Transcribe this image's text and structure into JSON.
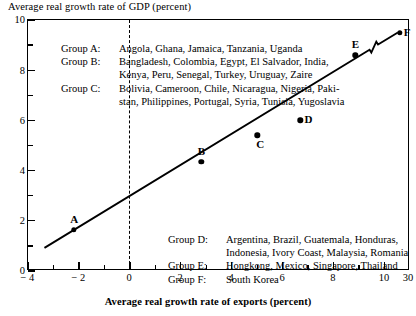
{
  "chart_data": {
    "type": "scatter",
    "title": "",
    "ylabel": "Average real growth rate of GDP (percent)",
    "xlabel": "Average real growth rate of exports (percent)",
    "xlim": [
      -4,
      11
    ],
    "ylim": [
      0,
      10
    ],
    "x_ticks": [
      {
        "value": -4,
        "label": "− 4",
        "major": true
      },
      {
        "value": -3,
        "label": "",
        "major": false
      },
      {
        "value": -2,
        "label": "− 2",
        "major": true
      },
      {
        "value": -1,
        "label": "",
        "major": false
      },
      {
        "value": 0,
        "label": "0",
        "major": true
      },
      {
        "value": 1,
        "label": "",
        "major": false
      },
      {
        "value": 2,
        "label": "2",
        "major": true
      },
      {
        "value": 3,
        "label": "",
        "major": false
      },
      {
        "value": 4,
        "label": "4",
        "major": true
      },
      {
        "value": 5,
        "label": "",
        "major": false
      },
      {
        "value": 6,
        "label": "6",
        "major": true
      },
      {
        "value": 7,
        "label": "",
        "major": false
      },
      {
        "value": 8,
        "label": "8",
        "major": true
      },
      {
        "value": 9,
        "label": "",
        "major": false
      },
      {
        "value": 10,
        "label": "10",
        "major": true
      },
      {
        "value": 11,
        "label": "30",
        "major": true
      }
    ],
    "y_ticks": [
      {
        "value": 0,
        "label": "0",
        "major": true
      },
      {
        "value": 1,
        "label": "",
        "major": false
      },
      {
        "value": 2,
        "label": "2",
        "major": true
      },
      {
        "value": 3,
        "label": "",
        "major": false
      },
      {
        "value": 4,
        "label": "4",
        "major": true
      },
      {
        "value": 5,
        "label": "",
        "major": false
      },
      {
        "value": 6,
        "label": "6",
        "major": true
      },
      {
        "value": 7,
        "label": "",
        "major": false
      },
      {
        "value": 8,
        "label": "8",
        "major": true
      },
      {
        "value": 9,
        "label": "",
        "major": false
      },
      {
        "value": 10,
        "label": "10",
        "major": true
      }
    ],
    "x_axis_break": {
      "between": [
        10,
        11
      ],
      "note": "axis break between 10 and 30"
    },
    "grid": false,
    "zero_reference_line": {
      "x": 0,
      "style": "dashed"
    },
    "points": [
      {
        "label": "A",
        "x": -2.2,
        "y": 1.65,
        "label_pos": "above"
      },
      {
        "label": "B",
        "x": 2.8,
        "y": 4.35,
        "label_pos": "above"
      },
      {
        "label": "C",
        "x": 5.0,
        "y": 5.4,
        "label_pos": "below-right"
      },
      {
        "label": "D",
        "x": 6.7,
        "y": 6.0,
        "label_pos": "right"
      },
      {
        "label": "E",
        "x": 8.85,
        "y": 8.6,
        "label_pos": "above"
      },
      {
        "label": "F",
        "x": 10.6,
        "y": 9.5,
        "label_pos": "right"
      }
    ],
    "fit_line": {
      "type": "regression",
      "x_start": -3.35,
      "y_start": 0.85,
      "x_end": 10.6,
      "y_end": 9.5,
      "has_break_marker": true,
      "break_at_x": 9.65
    },
    "legend_top": [
      {
        "key": "Group A:",
        "value": "Angola, Ghana, Jamaica, Tanzania, Uganda",
        "cont": ""
      },
      {
        "key": "Group B:",
        "value": "Bangladesh,  Colombia,  Egypt,  El Salvador,  India,",
        "cont": "Kenya, Peru, Senegal, Turkey, Uruguay, Zaire"
      },
      {
        "key": "Group C:",
        "value": "Bolivia, Cameroon, Chile, Nicaragua, Nigeria, Paki-",
        "cont": "stan, Philippines, Portugal, Syria, Tunisia, Yugoslavia"
      }
    ],
    "legend_bottom": [
      {
        "key": "Group D:",
        "value": "Argentina,  Brazil,  Guatemala,  Honduras,",
        "cont": "Indonesia,  Ivory Coast, Malaysia, Romania"
      },
      {
        "key": "Group E:",
        "value": "Hongkong, Mexico, Singapore, Thailand",
        "cont": ""
      },
      {
        "key": "Group F:",
        "value": "South Korea",
        "cont": ""
      }
    ]
  }
}
